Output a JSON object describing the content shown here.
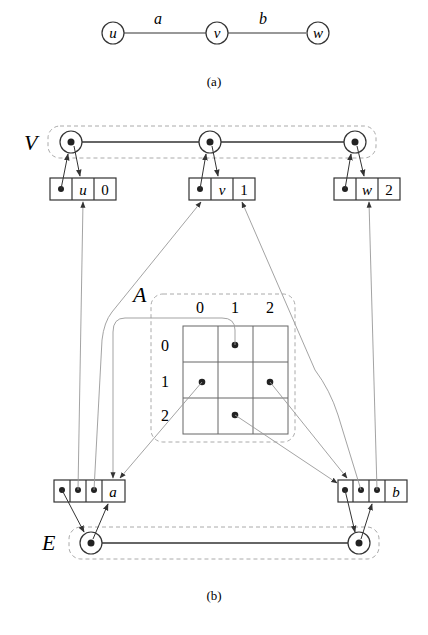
{
  "figure_a": {
    "caption": "(a)",
    "vertices": [
      "u",
      "v",
      "w"
    ],
    "edges": [
      {
        "label": "a",
        "from": "u",
        "to": "v"
      },
      {
        "label": "b",
        "from": "v",
        "to": "w"
      }
    ]
  },
  "figure_b": {
    "caption": "(b)",
    "vertex_list_label": "V",
    "edge_list_label": "E",
    "matrix_label": "A",
    "vertex_records": [
      {
        "name": "u",
        "index": "0"
      },
      {
        "name": "v",
        "index": "1"
      },
      {
        "name": "w",
        "index": "2"
      }
    ],
    "edge_records": [
      {
        "name": "a"
      },
      {
        "name": "b"
      }
    ],
    "matrix": {
      "col_headers": [
        "0",
        "1",
        "2"
      ],
      "row_headers": [
        "0",
        "1",
        "2"
      ],
      "filled_cells": [
        [
          0,
          1
        ],
        [
          1,
          0
        ],
        [
          1,
          2
        ],
        [
          2,
          1
        ]
      ]
    }
  },
  "colors": {
    "stroke": "#333333",
    "pointer_line": "#999999",
    "dashed_container": "#aaaaaa",
    "dot": "#222222"
  }
}
